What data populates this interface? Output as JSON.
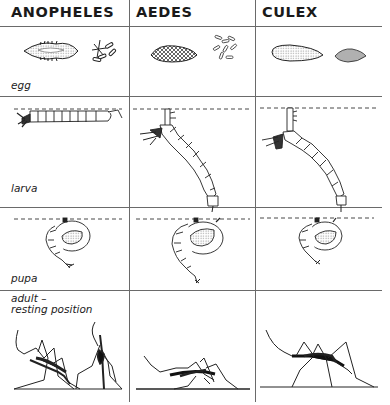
{
  "columns": [
    {
      "id": "anopheles",
      "label": "ANOPHELES"
    },
    {
      "id": "aedes",
      "label": "AEDES"
    },
    {
      "id": "culex",
      "label": "CULEX"
    }
  ],
  "rows": [
    {
      "id": "egg",
      "label": "egg"
    },
    {
      "id": "larva",
      "label": "larva"
    },
    {
      "id": "pupa",
      "label": "pupa"
    },
    {
      "id": "adult",
      "label_line1": "adult –",
      "label_line2": "resting position"
    }
  ],
  "colors": {
    "line": "#6a6a6a",
    "ink": "#1a1a1a",
    "background": "#ffffff"
  }
}
